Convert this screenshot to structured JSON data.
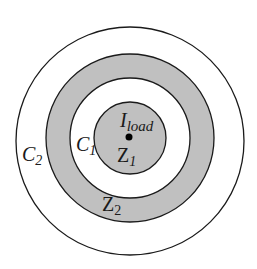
{
  "diagram": {
    "type": "concentric-circles",
    "colors": {
      "background": "#ffffff",
      "shaded": "#c0c0c0",
      "stroke": "#1a1a1a",
      "dot": "#000000"
    },
    "labels": {
      "center": {
        "main": "I",
        "sub": "load"
      },
      "inner_zone": {
        "main": "Z",
        "sub": "1"
      },
      "inner_boundary": {
        "main": "C",
        "sub": "1"
      },
      "outer_zone": {
        "main": "Z",
        "sub": "2"
      },
      "outer_boundary": {
        "main": "C",
        "sub": "2"
      }
    }
  }
}
